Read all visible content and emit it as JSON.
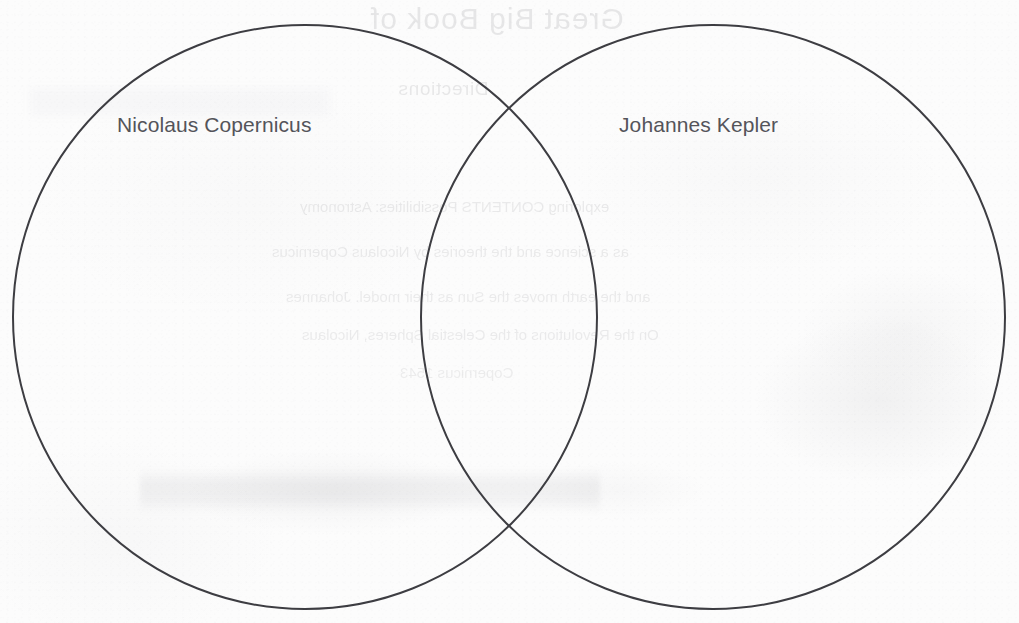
{
  "page": {
    "width": 1019,
    "height": 623,
    "background_color": "#fcfcfc",
    "media": "scanned-paper-worksheet"
  },
  "diagram": {
    "type": "venn",
    "set_count": 2,
    "stroke_color": "#3d3d42",
    "stroke_width": 2,
    "fill": "none",
    "label_color": "#54545a",
    "circles": [
      {
        "id": "left",
        "cx": 305,
        "cy": 317,
        "r": 292
      },
      {
        "id": "right",
        "cx": 713,
        "cy": 317,
        "r": 292
      }
    ],
    "intersection_points": [
      {
        "x": 518,
        "y": 95
      },
      {
        "x": 518,
        "y": 540
      }
    ],
    "regions": {
      "left_only": "",
      "overlap": "",
      "right_only": ""
    }
  },
  "labels": {
    "left": "Nicolaus Copernicus",
    "right": "Johannes Kepler"
  },
  "bleed_through": {
    "note": "faint mirrored text showing through from the reverse side of the sheet",
    "title": "Great Big Book of",
    "subtitle": "Directions",
    "lines": [
      "exploring CONTENTS Possibilities: Astronomy",
      "as a science and the theories by Nicolaus Copernicus",
      "and the earth moves the Sun as their model. Johannes",
      "On the Revolutions of the Celestial Spheres, Nicolaus",
      "Copernicus 1543"
    ]
  }
}
